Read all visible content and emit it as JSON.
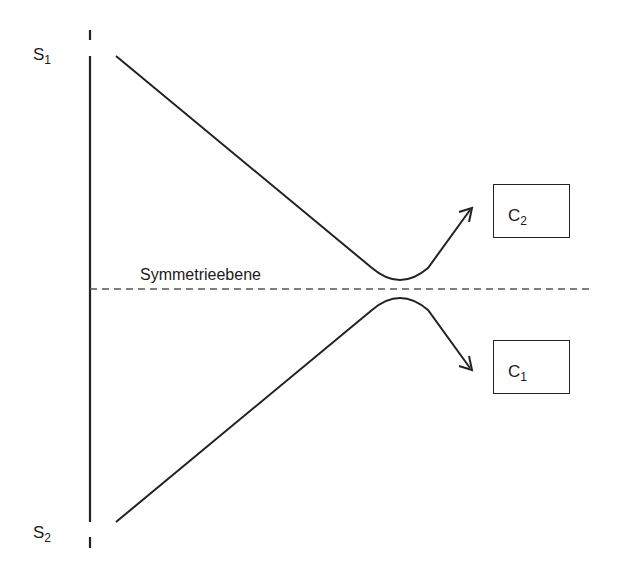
{
  "diagram": {
    "type": "trajectory-symmetry-diagram",
    "colors": {
      "line": "#222222",
      "background": "#ffffff",
      "dashed": "#555555"
    },
    "labels": {
      "s1": {
        "base": "S",
        "sub": "1"
      },
      "s2": {
        "base": "S",
        "sub": "2"
      },
      "c1": {
        "base": "C",
        "sub": "1"
      },
      "c2": {
        "base": "C",
        "sub": "2"
      },
      "symmetry_plane": "Symmetrieebene"
    },
    "nodes": [
      {
        "id": "S1",
        "label": "S1",
        "position": "top-left"
      },
      {
        "id": "S2",
        "label": "S2",
        "position": "bottom-left"
      },
      {
        "id": "C2",
        "label": "C2",
        "shape": "box",
        "position": "upper-right"
      },
      {
        "id": "C1",
        "label": "C1",
        "shape": "box",
        "position": "lower-right"
      }
    ],
    "edges": [
      {
        "from": "S1",
        "to": "C2",
        "style": "solid",
        "arrow": "end",
        "note": "approaches symmetry plane, turns back upward"
      },
      {
        "from": "S2",
        "to": "C1",
        "style": "solid",
        "arrow": "end",
        "note": "approaches symmetry plane, turns back downward"
      }
    ],
    "symmetry_line": {
      "style": "dashed",
      "orientation": "horizontal"
    }
  }
}
